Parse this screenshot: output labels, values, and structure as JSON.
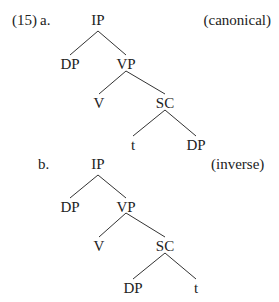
{
  "example_number": "(15)",
  "trees": [
    {
      "label": "a.",
      "annotation": "(canonical)",
      "nodes": {
        "root": "IP",
        "left": "DP",
        "vp": "VP",
        "v": "V",
        "sc": "SC",
        "sc_left": "t",
        "sc_right": "DP"
      }
    },
    {
      "label": "b.",
      "annotation": "(inverse)",
      "nodes": {
        "root": "IP",
        "left": "DP",
        "vp": "VP",
        "v": "V",
        "sc": "SC",
        "sc_left": "DP",
        "sc_right": "t"
      }
    }
  ]
}
